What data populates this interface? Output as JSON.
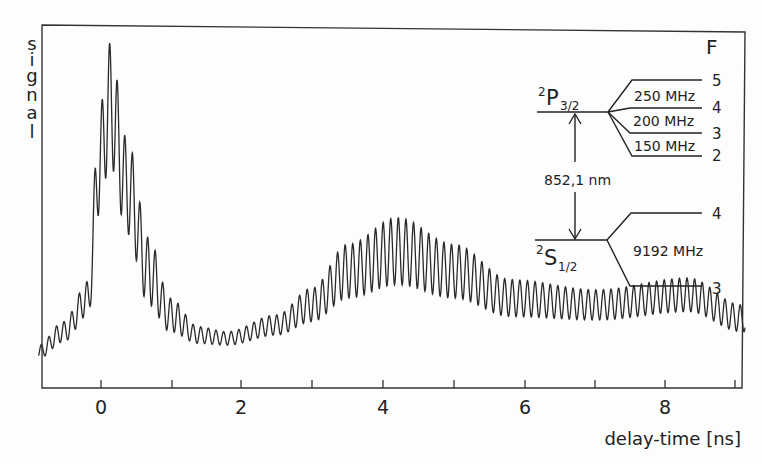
{
  "chart_data": {
    "type": "line",
    "title": "",
    "xlabel": "delay-time [ns]",
    "ylabel": "signal",
    "xlim": [
      -0.85,
      9.1
    ],
    "xticks": [
      0,
      1,
      2,
      3,
      4,
      5,
      6,
      7,
      8,
      9
    ],
    "xtick_labels": [
      "0",
      "",
      "2",
      "",
      "4",
      "",
      "6",
      "",
      "8",
      ""
    ],
    "grid": false,
    "legend": null,
    "series": [
      {
        "name": "quantum beat signal",
        "description": "Decaying signal with fast oscillation (period ~0.107 ns); sharp peak near 0.15 ns, minimum near 1.8 ns, second broad maximum near 4.2 ns, weak third maximum near 8.3 ns",
        "oscillation_period_ns": 0.107,
        "envelope_points": [
          {
            "x": -0.85,
            "mean": 0.06,
            "amp": 0.02
          },
          {
            "x": -0.5,
            "mean": 0.12,
            "amp": 0.03
          },
          {
            "x": -0.15,
            "mean": 0.22,
            "amp": 0.05
          },
          {
            "x": 0.0,
            "mean": 0.62,
            "amp": 0.15
          },
          {
            "x": 0.15,
            "mean": 0.8,
            "amp": 0.18
          },
          {
            "x": 0.4,
            "mean": 0.55,
            "amp": 0.14
          },
          {
            "x": 0.7,
            "mean": 0.3,
            "amp": 0.1
          },
          {
            "x": 1.0,
            "mean": 0.17,
            "amp": 0.05
          },
          {
            "x": 1.4,
            "mean": 0.11,
            "amp": 0.025
          },
          {
            "x": 1.8,
            "mean": 0.1,
            "amp": 0.02
          },
          {
            "x": 2.5,
            "mean": 0.14,
            "amp": 0.03
          },
          {
            "x": 3.0,
            "mean": 0.2,
            "amp": 0.05
          },
          {
            "x": 3.5,
            "mean": 0.3,
            "amp": 0.08
          },
          {
            "x": 4.2,
            "mean": 0.36,
            "amp": 0.1
          },
          {
            "x": 5.0,
            "mean": 0.3,
            "amp": 0.08
          },
          {
            "x": 5.8,
            "mean": 0.22,
            "amp": 0.055
          },
          {
            "x": 7.0,
            "mean": 0.2,
            "amp": 0.045
          },
          {
            "x": 8.3,
            "mean": 0.23,
            "amp": 0.05
          },
          {
            "x": 9.05,
            "mean": 0.16,
            "amp": 0.04
          }
        ],
        "ylim": [
          0,
          1
        ]
      }
    ],
    "annotations": {
      "inset_title": "F",
      "upper_state": {
        "label_main": "P",
        "superscript": "2",
        "subscript": "3/2"
      },
      "lower_state": {
        "label_main": "S",
        "superscript": "2",
        "subscript": "1/2"
      },
      "transition": "852,1 nm",
      "upper_levels": [
        {
          "F": "5"
        },
        {
          "F": "4"
        },
        {
          "F": "3"
        },
        {
          "F": "2"
        }
      ],
      "upper_splittings": [
        "250 MHz",
        "200 MHz",
        "150 MHz"
      ],
      "lower_levels": [
        {
          "F": "4"
        },
        {
          "F": "3"
        }
      ],
      "lower_splitting": "9192 MHz"
    }
  },
  "axis": {
    "ylabel_letters": [
      "s",
      "i",
      "g",
      "n",
      "a",
      "l"
    ],
    "xlabel": "delay-time [ns]",
    "tick_labels": {
      "0": "0",
      "2": "2",
      "4": "4",
      "6": "6",
      "8": "8"
    }
  },
  "inset": {
    "F_header": "F",
    "p_sup": "2",
    "p_main": "P",
    "p_sub": "3/2",
    "s_sup": "2",
    "s_main": "S",
    "s_sub": "1/2",
    "wavelength": "852,1 nm",
    "upper_F": [
      "5",
      "4",
      "3",
      "2"
    ],
    "upper_split": [
      "250 MHz",
      "200 MHz",
      "150 MHz"
    ],
    "lower_F": [
      "4",
      "3"
    ],
    "lower_split": "9192 MHz"
  }
}
